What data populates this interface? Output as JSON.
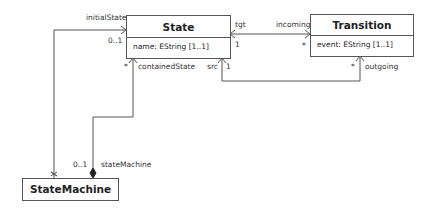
{
  "classes": {
    "state": {
      "name": "State",
      "attributes": [
        "name: EString [1..1]"
      ]
    },
    "transition": {
      "name": "Transition",
      "attributes": [
        "event: EString [1..1]"
      ]
    },
    "state_machine": {
      "name": "StateMachine",
      "attributes": []
    }
  },
  "associations": {
    "initial_state": {
      "role": "initialState",
      "multiplicity": "0..1"
    },
    "contained_state": {
      "role": "containedState",
      "multiplicity": "*"
    },
    "state_machine": {
      "role": "stateMachine",
      "multiplicity": "0..1"
    },
    "tgt": {
      "role": "tgt",
      "multiplicity": "1"
    },
    "incoming": {
      "role": "incoming",
      "multiplicity": "*"
    },
    "src": {
      "role": "src",
      "multiplicity": "1"
    },
    "outgoing": {
      "role": "outgoing",
      "multiplicity": "*"
    }
  },
  "colors": {
    "line": "#555555",
    "text": "#222222",
    "background": "#ffffff"
  }
}
